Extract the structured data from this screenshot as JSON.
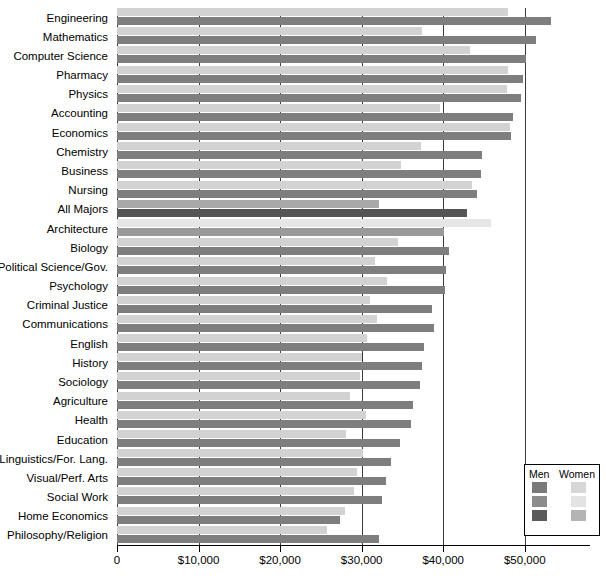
{
  "chart_data": {
    "type": "bar",
    "orientation": "horizontal",
    "title": "",
    "subtitle": "",
    "xlabel": "",
    "ylabel": "",
    "xlim": [
      0,
      58000
    ],
    "grid": true,
    "gridlines_at": [
      0,
      10000,
      20000,
      30000,
      40000,
      50000
    ],
    "tick_labels": [
      "0",
      "$10,000",
      "$20,000",
      "$30,000",
      "$40,000",
      "$50,000"
    ],
    "tick_values": [
      0,
      10000,
      20000,
      30000,
      40000,
      50000
    ],
    "legend": {
      "position": "bottom-right",
      "column_headers": [
        "Men",
        "Women"
      ],
      "swatches": [
        {
          "men": "#7a7a7a",
          "women": "#d7d7d7"
        },
        {
          "men": "#8c8c8c",
          "women": "#e3e3e3"
        },
        {
          "men": "#5a5a5a",
          "women": "#b4b4b4"
        }
      ]
    },
    "categories": [
      "Engineering",
      "Mathematics",
      "Computer Science",
      "Pharmacy",
      "Physics",
      "Accounting",
      "Economics",
      "Chemistry",
      "Business",
      "Nursing",
      "All Majors",
      "Architecture",
      "Biology",
      "Political Science/Gov.",
      "Psychology",
      "Criminal Justice",
      "Communications",
      "English",
      "History",
      "Sociology",
      "Agriculture",
      "Health",
      "Education",
      "Linguistics/For. Lang.",
      "Visual/Perf. Arts",
      "Social Work",
      "Home Economics",
      "Philosophy/Religion"
    ],
    "series": [
      {
        "name": "Men",
        "values": [
          53200,
          51400,
          50200,
          49800,
          49600,
          48500,
          48300,
          44800,
          44600,
          44200,
          42900,
          40100,
          40700,
          40400,
          40200,
          38600,
          38900,
          37700,
          37400,
          37100,
          36300,
          36000,
          34700,
          33600,
          33000,
          32500,
          27400,
          32100
        ]
      },
      {
        "name": "Women",
        "values": [
          48000,
          37400,
          43300,
          47900,
          47800,
          39600,
          48200,
          37300,
          34800,
          43500,
          32100,
          45900,
          34400,
          31600,
          33100,
          31000,
          31900,
          30700,
          30000,
          29800,
          28600,
          30500,
          28100,
          30200,
          29400,
          29000,
          27900,
          25700
        ]
      }
    ],
    "highlight_rows": {
      "All Majors": "dark",
      "Architecture": "light"
    }
  },
  "legend": {
    "men_label": "Men",
    "women_label": "Women"
  }
}
